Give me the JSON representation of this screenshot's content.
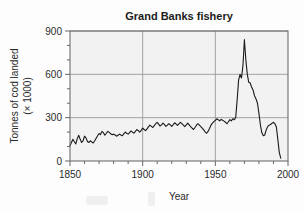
{
  "chart_data": {
    "type": "line",
    "title": "Grand Banks fishery",
    "xlabel": "Year",
    "ylabel_line1": "Tonnes of cod landed",
    "ylabel_line2": "(× 1000)",
    "xlim": [
      1850,
      2000
    ],
    "ylim": [
      0,
      900
    ],
    "xticks": [
      1850,
      1900,
      1950,
      2000
    ],
    "xtick_labels": [
      "1850",
      "1900",
      "1950",
      "2000"
    ],
    "yticks": [
      0,
      300,
      600,
      900
    ],
    "ytick_labels": [
      "0",
      "300",
      "600",
      "900"
    ],
    "x_minor_tick_step": 10,
    "y_minor_tick_step": 100,
    "grid": "major-xy",
    "legend": "none",
    "series": [
      {
        "name": "Cod landings",
        "color": "#1a1a1a",
        "x": [
          1850,
          1851,
          1852,
          1853,
          1854,
          1855,
          1856,
          1857,
          1858,
          1859,
          1860,
          1861,
          1862,
          1863,
          1864,
          1865,
          1866,
          1867,
          1868,
          1869,
          1870,
          1871,
          1872,
          1873,
          1874,
          1875,
          1876,
          1877,
          1878,
          1879,
          1880,
          1881,
          1882,
          1883,
          1884,
          1885,
          1886,
          1887,
          1888,
          1889,
          1890,
          1891,
          1892,
          1893,
          1894,
          1895,
          1896,
          1897,
          1898,
          1899,
          1900,
          1901,
          1902,
          1903,
          1904,
          1905,
          1906,
          1907,
          1908,
          1909,
          1910,
          1911,
          1912,
          1913,
          1914,
          1915,
          1916,
          1917,
          1918,
          1919,
          1920,
          1921,
          1922,
          1923,
          1924,
          1925,
          1926,
          1927,
          1928,
          1929,
          1930,
          1931,
          1932,
          1933,
          1934,
          1935,
          1936,
          1937,
          1938,
          1939,
          1940,
          1941,
          1942,
          1943,
          1944,
          1945,
          1946,
          1947,
          1948,
          1949,
          1950,
          1951,
          1952,
          1953,
          1954,
          1955,
          1956,
          1957,
          1958,
          1959,
          1960,
          1961,
          1962,
          1963,
          1964,
          1965,
          1966,
          1967,
          1968,
          1969,
          1970,
          1971,
          1972,
          1973,
          1974,
          1975,
          1976,
          1977,
          1978,
          1979,
          1980,
          1981,
          1982,
          1983,
          1984,
          1985,
          1986,
          1987,
          1988,
          1989,
          1990,
          1991,
          1992,
          1993,
          1994,
          1995
        ],
        "values": [
          105,
          128,
          150,
          133,
          118,
          155,
          178,
          150,
          128,
          140,
          172,
          160,
          135,
          128,
          140,
          132,
          125,
          140,
          158,
          175,
          190,
          183,
          205,
          196,
          178,
          192,
          205,
          198,
          188,
          182,
          186,
          180,
          172,
          178,
          186,
          180,
          175,
          188,
          200,
          192,
          186,
          196,
          208,
          200,
          192,
          205,
          218,
          210,
          200,
          212,
          228,
          218,
          210,
          222,
          236,
          248,
          240,
          232,
          245,
          258,
          268,
          255,
          242,
          250,
          262,
          252,
          240,
          248,
          258,
          250,
          240,
          252,
          265,
          256,
          246,
          258,
          268,
          258,
          248,
          238,
          250,
          262,
          250,
          238,
          228,
          218,
          232,
          248,
          258,
          248,
          238,
          228,
          215,
          202,
          192,
          205,
          225,
          248,
          262,
          272,
          282,
          292,
          286,
          278,
          288,
          282,
          276,
          268,
          258,
          272,
          286,
          278,
          292,
          286,
          300,
          420,
          560,
          600,
          575,
          660,
          840,
          700,
          600,
          545,
          540,
          510,
          490,
          450,
          430,
          400,
          330,
          250,
          195,
          175,
          180,
          215,
          238,
          248,
          252,
          262,
          268,
          258,
          235,
          150,
          60,
          20
        ]
      }
    ]
  },
  "figure": {
    "background_color": "#fdfdfd",
    "plot_background_color": "#f2f2f2",
    "grid_color": "#9a9a9a",
    "frame_color": "#6e6e6e",
    "line_color": "#1a1a1a"
  }
}
